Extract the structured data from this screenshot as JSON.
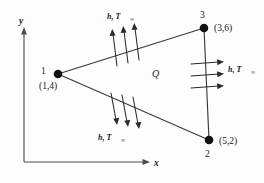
{
  "figure": {
    "background_color": "#fdfdfd",
    "line_color": "#3a3a3a",
    "node_color": "#111111"
  },
  "axes": {
    "x_label": "x",
    "y_label": "y",
    "origin_label": ""
  },
  "nodes": [
    {
      "id": "1",
      "number": "1",
      "coord_label": "(1,4)"
    },
    {
      "id": "2",
      "number": "2",
      "coord_label": "(5,2)"
    },
    {
      "id": "3",
      "number": "3",
      "coord_label": "(3,6)"
    }
  ],
  "interior": {
    "source_label": "Q"
  },
  "boundary_conditions": [
    {
      "edge": "top",
      "label_main": "h, T",
      "label_sub": "∞",
      "arrow_count": 3,
      "arrow_direction": "outward-up"
    },
    {
      "edge": "right",
      "label_main": "h, T",
      "label_sub": "∞",
      "arrow_count": 3,
      "arrow_direction": "outward-right"
    },
    {
      "edge": "bottom",
      "label_main": "h, T",
      "label_sub": "∞",
      "arrow_count": 3,
      "arrow_direction": "outward-down"
    }
  ]
}
